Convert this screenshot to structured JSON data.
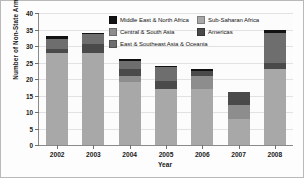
{
  "chart_data": {
    "type": "bar",
    "stacked": true,
    "title": "",
    "xlabel": "Year",
    "ylabel": "Number of Non-State Armed Conflicts",
    "categories": [
      "2002",
      "2003",
      "2004",
      "2005",
      "2006",
      "2007",
      "2008"
    ],
    "ylim": [
      0,
      40
    ],
    "yticks": [
      "0",
      "5",
      "10",
      "15",
      "20",
      "25",
      "30",
      "35",
      "40"
    ],
    "grid": true,
    "legend_position": "top-center-inside",
    "series": [
      {
        "name": "Sub-Saharan Africa",
        "color": "#a8a8a8",
        "values": [
          28,
          28,
          19,
          17,
          17,
          8,
          23
        ]
      },
      {
        "name": "Central & South Asia",
        "color": "#8d8d8d",
        "values": [
          0,
          0,
          2,
          0,
          4,
          4,
          0
        ]
      },
      {
        "name": "Americas",
        "color": "#4a4a4a",
        "values": [
          1,
          2.5,
          2,
          2.5,
          1.5,
          4,
          2
        ]
      },
      {
        "name": "East & Southeast Asia & Oceania",
        "color": "#6e6e6e",
        "values": [
          3,
          3,
          2.5,
          4,
          0,
          0,
          9
        ]
      },
      {
        "name": "Middle East & North Africa",
        "color": "#121212",
        "values": [
          1,
          0.5,
          0.5,
          0.5,
          0.5,
          0,
          1
        ]
      }
    ],
    "totals": [
      33,
      34,
      26,
      24,
      23,
      16,
      35
    ]
  },
  "legend": {
    "items": [
      {
        "label": "Middle East & North Africa",
        "color": "#121212"
      },
      {
        "label": "Sub-Saharan Africa",
        "color": "#a8a8a8"
      },
      {
        "label": "Central & South Asia",
        "color": "#8d8d8d"
      },
      {
        "label": "Americas",
        "color": "#4a4a4a"
      },
      {
        "label": "East & Southeast Asia & Oceania",
        "color": "#6e6e6e"
      }
    ]
  }
}
